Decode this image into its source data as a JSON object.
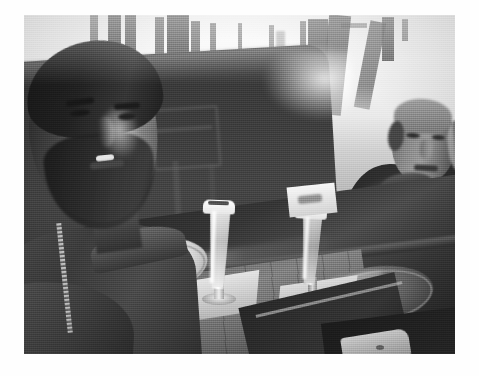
{
  "media": {
    "type": "photograph",
    "color_mode": "black-and-white",
    "orientation": "landscape",
    "border": "white mount border",
    "quality_notes": "grainy, soft focus, overexposed background windows",
    "alt_text": "Black and white selfie of a young bearded man and an older man seated at a pub table with two tall pilsner beers"
  },
  "scene": {
    "setting": "pub / restaurant interior",
    "time_of_day": "daytime, bright backlit windows",
    "subjects": [
      {
        "id": "person-left",
        "role": "selfie-taker",
        "description": "young man with dark hair and full beard, smiling, wearing a dark zip-up jacket",
        "position": "foreground left"
      },
      {
        "id": "person-right",
        "role": "companion",
        "description": "older balding man in a dark jacket, hand raised near his face",
        "position": "background right"
      }
    ],
    "objects": [
      {
        "id": "beer-glass-1",
        "label": "tall pilsner beer glass with foam head",
        "position": "center of table"
      },
      {
        "id": "beer-glass-2",
        "label": "second pilsner beer glass with foam head",
        "position": "right of center"
      },
      {
        "id": "coaster-1",
        "label": "paper coaster under centre glass"
      },
      {
        "id": "coaster-2",
        "label": "paper coaster under right glass"
      },
      {
        "id": "plate-left",
        "label": "white plate with food and cutlery"
      },
      {
        "id": "plate-right",
        "label": "dark plate"
      },
      {
        "id": "table",
        "label": "dark polished wooden table"
      },
      {
        "id": "chair",
        "label": "wooden chair in background"
      },
      {
        "id": "windows",
        "label": "bright overexposed windows and door frames"
      },
      {
        "id": "menu-card",
        "label": "dark card or tray on table"
      },
      {
        "id": "napkin",
        "label": "white napkin at bottom edge"
      }
    ]
  },
  "palette": {
    "mount": "#fefefe",
    "highlight": "#f7f7f5",
    "midtone": "#8a8a88",
    "shadow": "#2b2926",
    "black": "#1d1b19"
  },
  "frame": {
    "photo_left": 24,
    "photo_top": 15,
    "photo_width": 431,
    "photo_height": 339,
    "canvas_width": 479,
    "canvas_height": 376
  }
}
